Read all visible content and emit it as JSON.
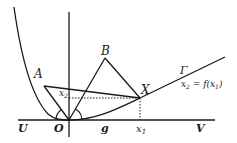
{
  "diagram": {
    "labels": {
      "A": "A",
      "B": "B",
      "X": "X",
      "O": "O",
      "U": "U",
      "V": "V",
      "g": "g",
      "Gamma": "Γ",
      "x1": "x",
      "x1_sub": "1",
      "x2": "x",
      "x2_sub": "2",
      "equation_lhs": "x",
      "equation_lhs_sub": "2",
      "equation_rhs": " = f(x",
      "equation_rhs_sub": "1",
      "equation_close": ")"
    },
    "points": {
      "O": [
        69,
        120
      ],
      "A": [
        44,
        86
      ],
      "B": [
        105,
        58
      ],
      "X": [
        140,
        98
      ]
    },
    "colors": {
      "stroke": "#1a1a1a",
      "background": "#ffffff"
    }
  }
}
